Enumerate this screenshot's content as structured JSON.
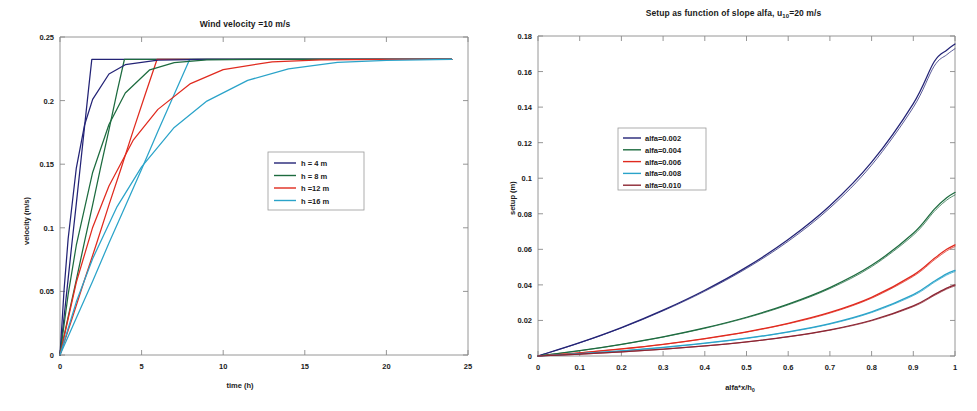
{
  "figure": {
    "background": "#ffffff",
    "panels": [
      "wind-velocity-panel",
      "setup-panel"
    ]
  },
  "chart_data": [
    {
      "id": "left",
      "type": "line",
      "title": "Wind velocity =10 m/s",
      "xlabel": "time (h)",
      "ylabel": "velocity (m/s)",
      "xlim": [
        0,
        25
      ],
      "ylim": [
        0,
        0.25
      ],
      "xticks": [
        "0",
        "5",
        "10",
        "15",
        "20",
        "25"
      ],
      "xtick_values": [
        0,
        5,
        10,
        15,
        20,
        25
      ],
      "yticks": [
        "0",
        "0.05",
        "0.1",
        "0.15",
        "0.2",
        "0.25"
      ],
      "ytick_values": [
        0,
        0.05,
        0.1,
        0.15,
        0.2,
        0.25
      ],
      "grid": false,
      "legend_position": "center-right",
      "asymptote": 0.2325,
      "series": [
        {
          "name": "h = 4 m",
          "color": "#232376",
          "ramp_end_time": 1.95,
          "points": [
            [
              0,
              0
            ],
            [
              0.25,
              0.03
            ],
            [
              0.5,
              0.06
            ],
            [
              0.75,
              0.09
            ],
            [
              1.0,
              0.119
            ],
            [
              1.25,
              0.149
            ],
            [
              1.5,
              0.179
            ],
            [
              1.75,
              0.209
            ],
            [
              1.95,
              0.2325
            ],
            [
              2.0,
              0.2325
            ],
            [
              5,
              0.2325
            ],
            [
              10,
              0.2325
            ],
            [
              15,
              0.2325
            ],
            [
              20,
              0.2325
            ],
            [
              24,
              0.2325
            ]
          ]
        },
        {
          "name": "h = 8 m",
          "color": "#1d6b3f",
          "ramp_end_time": 3.95,
          "points": [
            [
              0,
              0
            ],
            [
              0.5,
              0.03
            ],
            [
              1.0,
              0.059
            ],
            [
              1.5,
              0.089
            ],
            [
              2.0,
              0.118
            ],
            [
              2.5,
              0.148
            ],
            [
              3.0,
              0.177
            ],
            [
              3.5,
              0.207
            ],
            [
              3.95,
              0.2325
            ],
            [
              4.0,
              0.2325
            ],
            [
              8,
              0.2325
            ],
            [
              14,
              0.2325
            ],
            [
              20,
              0.2325
            ],
            [
              24,
              0.2325
            ]
          ]
        },
        {
          "name": "h =12 m",
          "color": "#e02a1e",
          "ramp_end_time": 5.95,
          "points": [
            [
              0,
              0
            ],
            [
              0.75,
              0.029
            ],
            [
              1.5,
              0.059
            ],
            [
              2.25,
              0.088
            ],
            [
              3.0,
              0.118
            ],
            [
              3.75,
              0.147
            ],
            [
              4.5,
              0.177
            ],
            [
              5.25,
              0.206
            ],
            [
              5.95,
              0.2325
            ],
            [
              6.0,
              0.2325
            ],
            [
              12,
              0.2325
            ],
            [
              18,
              0.2325
            ],
            [
              24,
              0.2325
            ]
          ]
        },
        {
          "name": "h =16 m",
          "color": "#2aa3c9",
          "ramp_end_time": 7.95,
          "points": [
            [
              0,
              0
            ],
            [
              1.0,
              0.029
            ],
            [
              2.0,
              0.058
            ],
            [
              3.0,
              0.088
            ],
            [
              4.0,
              0.117
            ],
            [
              5.0,
              0.146
            ],
            [
              6.0,
              0.176
            ],
            [
              7.0,
              0.205
            ],
            [
              7.95,
              0.2325
            ],
            [
              8.0,
              0.2325
            ],
            [
              14,
              0.2325
            ],
            [
              20,
              0.2325
            ],
            [
              24,
              0.2325
            ]
          ]
        },
        {
          "name": "h = 4 m (relaxation)",
          "color": "#232376",
          "time_constant": 1.0,
          "points": [
            [
              0,
              0
            ],
            [
              0.25,
              0.0513
            ],
            [
              0.5,
              0.0915
            ],
            [
              1.0,
              0.147
            ],
            [
              1.5,
              0.1806
            ],
            [
              2.0,
              0.201
            ],
            [
              3.0,
              0.2209
            ],
            [
              4.0,
              0.2282
            ],
            [
              6.0,
              0.2319
            ],
            [
              9.0,
              0.2325
            ],
            [
              14,
              0.2325
            ],
            [
              20,
              0.2325
            ],
            [
              24,
              0.2325
            ]
          ]
        },
        {
          "name": "h = 8 m (relaxation)",
          "color": "#1d6b3f",
          "time_constant": 2.2,
          "points": [
            [
              0,
              0
            ],
            [
              0.5,
              0.0477
            ],
            [
              1.0,
              0.0863
            ],
            [
              2.0,
              0.1435
            ],
            [
              3.0,
              0.1812
            ],
            [
              4.0,
              0.206
            ],
            [
              5.5,
              0.2242
            ],
            [
              7.0,
              0.2298
            ],
            [
              9.0,
              0.232
            ],
            [
              12,
              0.2325
            ],
            [
              18,
              0.2325
            ],
            [
              24,
              0.2325
            ]
          ]
        },
        {
          "name": "h =12 m (relaxation)",
          "color": "#e02a1e",
          "time_constant": 3.6,
          "points": [
            [
              0,
              0
            ],
            [
              1.0,
              0.0572
            ],
            [
              2.0,
              0.1003
            ],
            [
              3.0,
              0.1329
            ],
            [
              4.5,
              0.1692
            ],
            [
              6.0,
              0.1931
            ],
            [
              8.0,
              0.2134
            ],
            [
              10.0,
              0.2244
            ],
            [
              13.0,
              0.2305
            ],
            [
              16,
              0.232
            ],
            [
              20,
              0.2325
            ],
            [
              24,
              0.2325
            ]
          ]
        },
        {
          "name": "h =16 m (relaxation)",
          "color": "#2aa3c9",
          "time_constant": 5.1,
          "points": [
            [
              0,
              0
            ],
            [
              1.0,
              0.0418
            ],
            [
              2.0,
              0.0757
            ],
            [
              3.5,
              0.1167
            ],
            [
              5.0,
              0.1479
            ],
            [
              7.0,
              0.1789
            ],
            [
              9.0,
              0.1996
            ],
            [
              11.5,
              0.2159
            ],
            [
              14,
              0.225
            ],
            [
              17,
              0.2301
            ],
            [
              20,
              0.2316
            ],
            [
              24,
              0.2325
            ]
          ]
        }
      ],
      "legend": [
        {
          "label": "h = 4 m",
          "color": "#232376"
        },
        {
          "label": "h = 8 m",
          "color": "#1d6b3f"
        },
        {
          "label": "h =12 m",
          "color": "#e02a1e"
        },
        {
          "label": "h =16 m",
          "color": "#2aa3c9"
        }
      ]
    },
    {
      "id": "right",
      "type": "line",
      "title": "Setup as function of slope alfa, u10=20 m/s",
      "title_main": "Setup as function of slope alfa, u",
      "title_sub": "10",
      "title_tail": "=20 m/s",
      "xlabel": "alfa*x/h0",
      "xlabel_main": "alfa*x/h",
      "xlabel_sub": "0",
      "ylabel": "setup (m)",
      "xlim": [
        0,
        1
      ],
      "ylim": [
        0,
        0.18
      ],
      "xticks": [
        "0",
        "0.1",
        "0.2",
        "0.3",
        "0.4",
        "0.5",
        "0.6",
        "0.7",
        "0.8",
        "0.9",
        "1"
      ],
      "xtick_values": [
        0,
        0.1,
        0.2,
        0.3,
        0.4,
        0.5,
        0.6,
        0.7,
        0.8,
        0.9,
        1
      ],
      "yticks": [
        "0",
        "0.02",
        "0.04",
        "0.06",
        "0.08",
        "0.1",
        "0.12",
        "0.14",
        "0.16",
        "0.18"
      ],
      "ytick_values": [
        0,
        0.02,
        0.04,
        0.06,
        0.08,
        0.1,
        0.12,
        0.14,
        0.16,
        0.18
      ],
      "grid": false,
      "legend_position": "upper-left-center",
      "x": [
        0,
        0.1,
        0.2,
        0.3,
        0.4,
        0.5,
        0.6,
        0.7,
        0.8,
        0.9,
        0.95,
        0.98,
        1.0
      ],
      "series": [
        {
          "name": "alfa=0.002",
          "color": "#232376",
          "values": [
            0,
            0.0075,
            0.016,
            0.0258,
            0.037,
            0.05,
            0.0655,
            0.0845,
            0.109,
            0.142,
            0.1655,
            0.172,
            0.1755
          ]
        },
        {
          "name": "alfa=0.004",
          "color": "#1d6b3f",
          "values": [
            0,
            0.003,
            0.0066,
            0.0108,
            0.0158,
            0.0218,
            0.0292,
            0.0385,
            0.051,
            0.069,
            0.0825,
            0.089,
            0.092
          ]
        },
        {
          "name": "alfa=0.006",
          "color": "#e02a1e",
          "values": [
            0,
            0.0018,
            0.004,
            0.0066,
            0.0098,
            0.0136,
            0.0184,
            0.0245,
            0.033,
            0.0455,
            0.0548,
            0.06,
            0.0625
          ]
        },
        {
          "name": "alfa=0.008",
          "color": "#2aa3c9",
          "values": [
            0,
            0.0013,
            0.0029,
            0.0048,
            0.0072,
            0.01,
            0.0136,
            0.0182,
            0.0248,
            0.0345,
            0.042,
            0.0462,
            0.0482
          ]
        },
        {
          "name": "alfa=0.010",
          "color": "#8c2633",
          "values": [
            0,
            0.001,
            0.0023,
            0.0038,
            0.0057,
            0.008,
            0.0109,
            0.0147,
            0.0201,
            0.0282,
            0.0345,
            0.0382,
            0.04
          ]
        }
      ],
      "legend": [
        {
          "label": "alfa=0.002",
          "color": "#232376"
        },
        {
          "label": "alfa=0.004",
          "color": "#1d6b3f"
        },
        {
          "label": "alfa=0.006",
          "color": "#e02a1e"
        },
        {
          "label": "alfa=0.008",
          "color": "#2aa3c9"
        },
        {
          "label": "alfa=0.010",
          "color": "#8c2633"
        }
      ]
    }
  ]
}
